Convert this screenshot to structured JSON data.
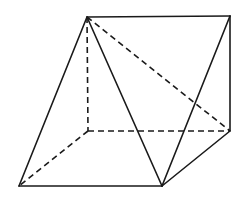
{
  "figure": {
    "type": "3d-solid-wireframe",
    "stroke_color": "#1a1a1a",
    "background": "#ffffff",
    "vertices": {
      "A": [
        87,
        17
      ],
      "B": [
        230,
        16
      ],
      "C": [
        230,
        131
      ],
      "D": [
        88,
        131
      ],
      "E": [
        19,
        186
      ],
      "F": [
        162,
        186
      ]
    },
    "solid_edges": [
      [
        "A",
        "B"
      ],
      [
        "B",
        "C"
      ],
      [
        "A",
        "E"
      ],
      [
        "E",
        "F"
      ],
      [
        "A",
        "F"
      ],
      [
        "F",
        "B"
      ],
      [
        "F",
        "C"
      ]
    ],
    "dashed_edges": [
      [
        "A",
        "D"
      ],
      [
        "D",
        "C"
      ],
      [
        "D",
        "E"
      ],
      [
        "A",
        "C"
      ]
    ]
  }
}
